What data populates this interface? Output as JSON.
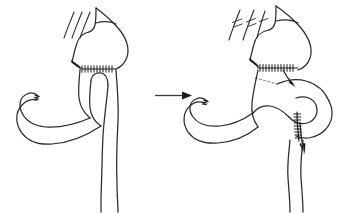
{
  "figure": {
    "title": "Roux-en-Y gastric bypass revision: before and after",
    "background_color": "#ffffff",
    "ink_color": "#2b2b2b",
    "panel_count": 2
  },
  "panels": [
    {
      "id": "panel-before",
      "label": "Before",
      "position": "left",
      "caption": "",
      "parts": [
        {
          "name": "gastric-pouch",
          "label": "Gastric pouch"
        },
        {
          "name": "esophagus-vessels",
          "label": "Divided vessels"
        },
        {
          "name": "gastrojejunal-suture-line",
          "label": "Gastrojejunal staple line"
        },
        {
          "name": "oblique-suture-line",
          "label": "Oblique staple line"
        },
        {
          "name": "roux-limb",
          "label": "Roux limb"
        },
        {
          "name": "blind-jejunal-limb",
          "label": "Blind jejunal limb"
        },
        {
          "name": "efferent-limb",
          "label": "Efferent limb"
        }
      ]
    },
    {
      "id": "panel-after",
      "label": "After",
      "position": "right",
      "caption": "",
      "parts": [
        {
          "name": "gastric-pouch",
          "label": "Gastric pouch"
        },
        {
          "name": "esophagus-vessels-ligated",
          "label": "Ligated vessels"
        },
        {
          "name": "gastrojejunal-suture-line",
          "label": "Gastrojejunal anastomosis"
        },
        {
          "name": "oblique-suture-line",
          "label": "Oblique staple line"
        },
        {
          "name": "jejunojejunal-suture-line",
          "label": "Jejunojejunal anastomosis"
        },
        {
          "name": "roux-limb",
          "label": "Roux limb"
        },
        {
          "name": "blind-jejunal-limb",
          "label": "Blind jejunal limb"
        },
        {
          "name": "efferent-limb",
          "label": "Efferent limb"
        },
        {
          "name": "upper-flow-arrow",
          "label": "Upper flow direction"
        },
        {
          "name": "lower-flow-arrow",
          "label": "Lower flow direction"
        }
      ]
    }
  ],
  "transition": {
    "name": "transition-arrow",
    "direction": "left-to-right",
    "label": ""
  },
  "annotations": {
    "suture_tick_count_primary": 17,
    "suture_tick_count_oblique": 12,
    "ligature_marks": 3
  },
  "colors": {
    "ink": "#2b2b2b",
    "suture": "#1a1a1a",
    "hidden_edge": "#6a6a6a",
    "background": "#ffffff"
  }
}
